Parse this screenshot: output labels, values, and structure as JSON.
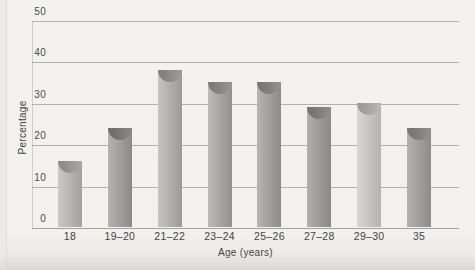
{
  "page": {
    "background_color": "#f2f1ee",
    "gridline_color": "#b2b1ae",
    "text_color": "#4b4a48"
  },
  "chart_data": {
    "type": "bar",
    "title": "",
    "xlabel": "Age (years)",
    "ylabel": "Percentage",
    "categories": [
      "18",
      "19–20",
      "21–22",
      "23–24",
      "25–26",
      "27–28",
      "29–30",
      "35"
    ],
    "values": [
      16,
      24,
      38,
      35,
      35,
      29,
      30,
      24
    ],
    "yticks": [
      0,
      10,
      20,
      30,
      40,
      50
    ],
    "ylim": [
      0,
      50
    ],
    "grid": true,
    "legend": "none",
    "bar_style": "cylinder-gradient",
    "bar_colors": [
      {
        "body_light": "#cac9c7",
        "body_dark": "#a2a19f",
        "cap_dark": "#8e8d8b",
        "cap_light": "#aaa9a7"
      },
      {
        "body_light": "#b4b3b1",
        "body_dark": "#8b8a88",
        "cap_dark": "#6f6e6c",
        "cap_light": "#8a8987"
      },
      {
        "body_light": "#c5c4c2",
        "body_dark": "#9b9a98",
        "cap_dark": "#828180",
        "cap_light": "#9e9d9b"
      },
      {
        "body_light": "#bcbbb9",
        "body_dark": "#929190",
        "cap_dark": "#7d7c7a",
        "cap_light": "#989795"
      },
      {
        "body_light": "#b6b5b3",
        "body_dark": "#8d8c8a",
        "cap_dark": "#787776",
        "cap_light": "#939290"
      },
      {
        "body_light": "#b1b0ae",
        "body_dark": "#898886",
        "cap_dark": "#757472",
        "cap_light": "#908f8d"
      },
      {
        "body_light": "#d7d6d4",
        "body_dark": "#b4b3b1",
        "cap_dark": "#9c9b99",
        "cap_light": "#bab9b7"
      },
      {
        "body_light": "#b3b2b0",
        "body_dark": "#8d8c8a",
        "cap_dark": "#797876",
        "cap_light": "#929190"
      }
    ]
  }
}
